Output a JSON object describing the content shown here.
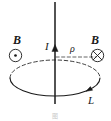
{
  "figure": {
    "caption": "图",
    "labels": {
      "b_left": "B",
      "b_right": "B",
      "current": "I",
      "radius": "ρ",
      "loop": "L"
    },
    "icons": {
      "field_out_of_page": "circle-dot-icon",
      "field_into_page": "circle-cross-icon",
      "current_arrow": "up-arrow-icon",
      "loop_arrow": "loop-direction-arrow-icon"
    },
    "colors": {
      "stroke": "#1a1a1a",
      "background": "#ffffff",
      "caption": "#c9c9c9"
    },
    "geometry": {
      "wire_x": 55,
      "wire_top_y": 2,
      "wire_bottom_y": 104,
      "loop_center_x": 55,
      "loop_center_y": 78,
      "loop_radius_x": 45,
      "loop_radius_y": 18,
      "radius_line_y": 57,
      "radius_line_x_end": 96
    }
  }
}
